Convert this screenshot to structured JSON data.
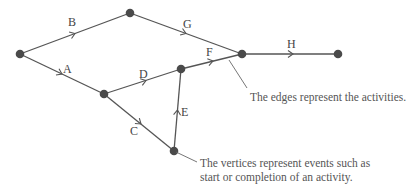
{
  "diagram": {
    "type": "activity-network",
    "nodes": [
      {
        "id": "n1",
        "x": 20,
        "y": 54
      },
      {
        "id": "n2",
        "x": 130,
        "y": 13
      },
      {
        "id": "n3",
        "x": 104,
        "y": 94
      },
      {
        "id": "n4",
        "x": 181,
        "y": 69
      },
      {
        "id": "n5",
        "x": 174,
        "y": 151
      },
      {
        "id": "n6",
        "x": 242,
        "y": 54
      },
      {
        "id": "n7",
        "x": 338,
        "y": 54
      }
    ],
    "edges": [
      {
        "label": "A",
        "from": "n1",
        "to": "n3"
      },
      {
        "label": "B",
        "from": "n1",
        "to": "n2"
      },
      {
        "label": "C",
        "from": "n3",
        "to": "n5"
      },
      {
        "label": "D",
        "from": "n3",
        "to": "n4"
      },
      {
        "label": "E",
        "from": "n5",
        "to": "n4"
      },
      {
        "label": "F",
        "from": "n4",
        "to": "n6"
      },
      {
        "label": "G",
        "from": "n2",
        "to": "n6"
      },
      {
        "label": "H",
        "from": "n6",
        "to": "n7"
      }
    ],
    "annotations": {
      "edges_note": "The edges represent the activities.",
      "vertices_note_line1": "The vertices represent events such as",
      "vertices_note_line2": "start or completion of an activity."
    }
  }
}
